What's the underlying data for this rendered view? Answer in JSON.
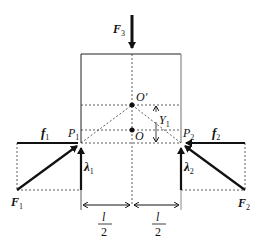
{
  "diagram": {
    "labels": {
      "F3": {
        "main": "F",
        "sub": "3"
      },
      "O_prime": "O′",
      "O": "O",
      "Y1": {
        "main": "Y",
        "sub": "1"
      },
      "P1": {
        "main": "P",
        "sub": "1"
      },
      "P2": {
        "main": "P",
        "sub": "2"
      },
      "f1": {
        "main": "f",
        "sub": "1"
      },
      "f2": {
        "main": "f",
        "sub": "2"
      },
      "lambda1": {
        "main": "λ",
        "sub": "1"
      },
      "lambda2": {
        "main": "λ",
        "sub": "2"
      },
      "F1": {
        "main": "F",
        "sub": "1"
      },
      "F2": {
        "main": "F",
        "sub": "2"
      },
      "half_l_left": {
        "num": "l",
        "den": "2"
      },
      "half_l_right": {
        "num": "l",
        "den": "2"
      }
    },
    "colors": {
      "stroke": "#111111",
      "dashed": "#333333",
      "background": "#ffffff"
    }
  }
}
